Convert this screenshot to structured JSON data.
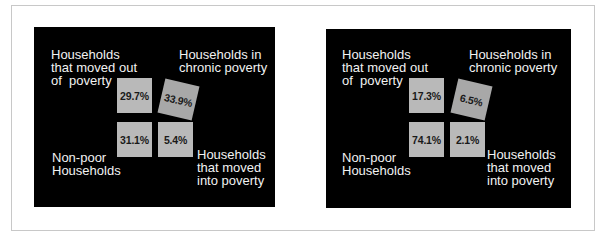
{
  "panels": [
    {
      "labels": {
        "moved_out": "Households\nthat moved out\nof  poverty",
        "chronic": "Households in\nchronic poverty",
        "non_poor": "Non-poor\nHouseholds",
        "moved_into": "Households\nthat moved\ninto poverty"
      },
      "values": {
        "moved_out": "29.7%",
        "chronic": "33.9%",
        "non_poor": "31.1%",
        "moved_into": "5.4%"
      }
    },
    {
      "labels": {
        "moved_out": "Households\nthat moved out\nof  poverty",
        "chronic": "Households in\nchronic poverty",
        "non_poor": "Non-poor\nHouseholds",
        "moved_into": "Households\nthat moved\ninto poverty"
      },
      "values": {
        "moved_out": "17.3%",
        "chronic": "6.5%",
        "non_poor": "74.1%",
        "moved_into": "2.1%"
      }
    }
  ],
  "colors": {
    "panel_bg": "#000000",
    "box": "#b9b9b9",
    "box_tilted": "#a8a8a8",
    "label_text": "#f2f2f2"
  }
}
